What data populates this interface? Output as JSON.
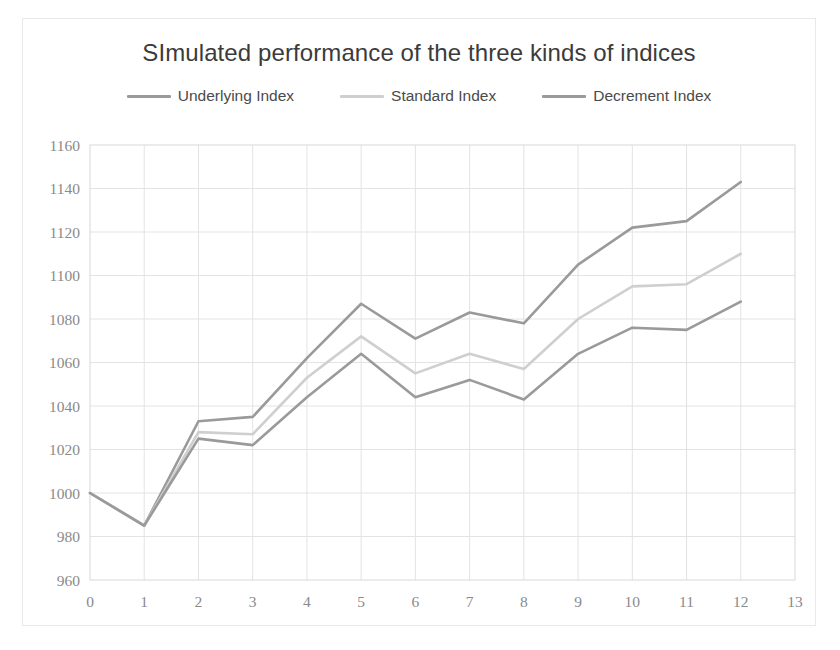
{
  "chart_data": {
    "type": "line",
    "title": "SImulated performance of the three kinds of indices",
    "xlabel": "",
    "ylabel": "",
    "x": [
      0,
      1,
      2,
      3,
      4,
      5,
      6,
      7,
      8,
      9,
      10,
      11,
      12
    ],
    "xlim": [
      0,
      13
    ],
    "ylim": [
      960,
      1160
    ],
    "xticks": [
      "0",
      "1",
      "2",
      "3",
      "4",
      "5",
      "6",
      "7",
      "8",
      "9",
      "10",
      "11",
      "12",
      "13"
    ],
    "yticks": [
      "960",
      "980",
      "1000",
      "1020",
      "1040",
      "1060",
      "1080",
      "1100",
      "1120",
      "1140",
      "1160"
    ],
    "grid": true,
    "legend_position": "top",
    "series": [
      {
        "name": "Underlying Index",
        "color": "#9a9a9a",
        "values": [
          1000,
          985,
          1033,
          1035,
          1062,
          1087,
          1071,
          1083,
          1078,
          1105,
          1122,
          1125,
          1143
        ]
      },
      {
        "name": "Standard Index",
        "color": "#cfcfcf",
        "values": [
          1000,
          985,
          1028,
          1027,
          1053,
          1072,
          1055,
          1064,
          1057,
          1080,
          1095,
          1096,
          1110
        ]
      },
      {
        "name": "Decrement Index",
        "color": "#9a9a9a",
        "values": [
          1000,
          985,
          1025,
          1022,
          1044,
          1064,
          1044,
          1052,
          1043,
          1064,
          1076,
          1075,
          1088
        ]
      }
    ]
  },
  "legend": {
    "items": [
      {
        "label": "Underlying Index",
        "color": "#9a9a9a"
      },
      {
        "label": "Standard Index",
        "color": "#cfcfcf"
      },
      {
        "label": "Decrement Index",
        "color": "#9a9a9a"
      }
    ]
  },
  "colors": {
    "plot_border": "#d8d8d8",
    "gridline": "#e3e3e3",
    "tick_label": "#8a8a8a",
    "title": "#3b3b3b"
  }
}
